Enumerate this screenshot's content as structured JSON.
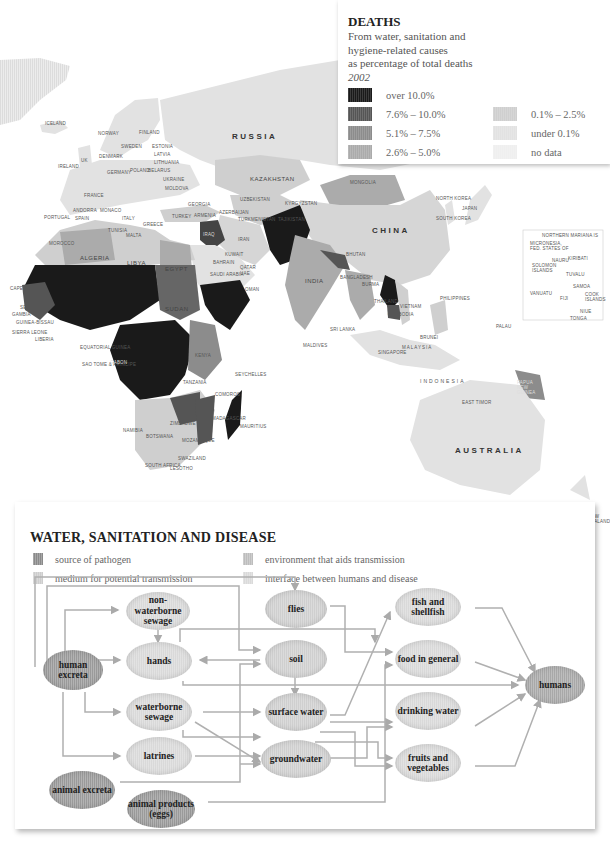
{
  "map": {
    "region_labels": {
      "russia": "RUSSIA",
      "china": "CHINA",
      "india": "INDIA",
      "australia": "AUSTRALIA",
      "indonesia": "INDONESIA",
      "malaysia": "MALAYSIA",
      "kazakhstan": "KAZAKHSTAN",
      "mongolia": "MONGOLIA",
      "japan": "JAPAN",
      "north_korea": "NORTH KOREA",
      "south_korea": "SOUTH KOREA",
      "iran": "IRAN",
      "iraq": "IRAQ",
      "saudi_arabia": "SAUDI ARABIA",
      "algeria": "ALGERIA",
      "libya": "LIBYA",
      "egypt": "EGYPT",
      "sudan": "SUDAN",
      "iceland": "ICELAND",
      "norway": "NORWAY",
      "sweden": "SWEDEN",
      "finland": "FINLAND",
      "estonia": "ESTONIA",
      "latvia": "LATVIA",
      "lithuania": "LITHUANIA",
      "uk": "UK",
      "ireland": "IRELAND",
      "denmark": "DENMARK",
      "germany": "GERMANY",
      "poland": "POLAND",
      "belarus": "BELARUS",
      "ukraine": "UKRAINE",
      "moldova": "MOLDOVA",
      "france": "FRANCE",
      "spain": "SPAIN",
      "portugal": "PORTUGAL",
      "andorra": "ANDORRA",
      "monaco": "MONACO",
      "italy": "ITALY",
      "greece": "GREECE",
      "turkey": "TURKEY",
      "georgia": "GEORGIA",
      "armenia": "ARMENIA",
      "azerbaijan": "AZERBAIJAN",
      "uzbekistan": "UZBEKISTAN",
      "turkmenistan": "TURKMENISTAN",
      "kyrgyzstan": "KYRGYZSTAN",
      "tajikistan": "TAJIKISTAN",
      "kuwait": "KUWAIT",
      "bahrain": "BAHRAIN",
      "qatar": "QATAR",
      "uae": "UAE",
      "oman": "OMAN",
      "morocco": "MOROCCO",
      "tunisia": "TUNISIA",
      "malta": "MALTA",
      "cape_verde": "CAPE VERDE",
      "senegal": "SENEGAL",
      "gambia": "GAMBIA",
      "guinea_bissau": "GUINEA-BISSAU",
      "sierra_leone": "SIERRA LEONE",
      "liberia": "LIBERIA",
      "equatorial_guinea": "EQUATORIAL GUINEA",
      "sao_tome": "SAO TOME & PRINCIPE",
      "gabon": "GABON",
      "kenya": "KENYA",
      "tanzania": "TANZANIA",
      "seychelles": "SEYCHELLES",
      "comoros": "COMOROS",
      "madagascar": "MADAGASCAR",
      "mauritius": "MAURITIUS",
      "namibia": "NAMIBIA",
      "botswana": "BOTSWANA",
      "zimbabwe": "ZIMBABWE",
      "mozambique": "MOZAMBIQUE",
      "swaziland": "SWAZILAND",
      "lesotho": "LESOTHO",
      "south_africa": "SOUTH AFRICA",
      "sri_lanka": "SRI LANKA",
      "maldives": "MALDIVES",
      "bhutan": "BHUTAN",
      "bangladesh": "BANGLADESH",
      "burma": "BURMA",
      "thailand": "THAILAND",
      "cambodia": "CAMBODIA",
      "vietnam": "VIETNAM",
      "philippines": "PHILIPPINES",
      "brunei": "BRUNEI",
      "singapore": "SINGAPORE",
      "east_timor": "EAST TIMOR",
      "papua_new_guinea": "PAPUA NEW GUINEA",
      "palau": "PALAU",
      "new_zealand": "NEW ZEALAND"
    },
    "pacific_inset": {
      "labels": [
        "NORTHERN MARIANA IS",
        "MICRONESIA, FED. STATES OF",
        "NAURU",
        "KIRIBATI",
        "SOLOMON ISLANDS",
        "TUVALU",
        "SAMOA",
        "VANUATU",
        "FIJI",
        "COOK ISLANDS",
        "NIUE",
        "TONGA"
      ]
    }
  },
  "deaths_legend": {
    "title": "DEATHS",
    "subtitle_lines": [
      "From water, sanitation and",
      "hygiene-related causes",
      "as percentage of total deaths"
    ],
    "year": "2002",
    "items": [
      {
        "label": "over 10.0%",
        "color": "#1a1a1a"
      },
      {
        "label": "7.6% – 10.0%",
        "color": "#555555"
      },
      {
        "label": "5.1% – 7.5%",
        "color": "#8c8c8c"
      },
      {
        "label": "2.6% – 5.0%",
        "color": "#ababab"
      },
      {
        "label": "0.1% – 2.5%",
        "color": "#cfcfcf"
      },
      {
        "label": "under 0.1%",
        "color": "#e2e2e2"
      },
      {
        "label": "no data",
        "color": "#efefef"
      }
    ]
  },
  "diagram": {
    "title": "WATER, SANITATION AND DISEASE",
    "legend": [
      {
        "label": "source of pathogen",
        "color": "#8a8a8a"
      },
      {
        "label": "environment that aids transmission",
        "color": "#bdbdbd"
      },
      {
        "label": "medium for potential transmission",
        "color": "#cdcdcd"
      },
      {
        "label": "interface between humans and disease",
        "color": "#dadada"
      }
    ],
    "nodes": {
      "human_excreta": "human excreta",
      "non_waterborne_sewage": "non-waterborne sewage",
      "hands": "hands",
      "waterborne_sewage": "waterborne sewage",
      "latrines": "latrines",
      "animal_excreta": "animal excreta",
      "animal_products": "animal products (eggs)",
      "flies": "flies",
      "soil": "soil",
      "surface_water": "surface water",
      "groundwater": "groundwater",
      "fish_shellfish": "fish and shellfish",
      "food_general": "food in general",
      "drinking_water": "drinking water",
      "fruits_vegetables": "fruits and vegetables",
      "humans": "humans"
    }
  }
}
